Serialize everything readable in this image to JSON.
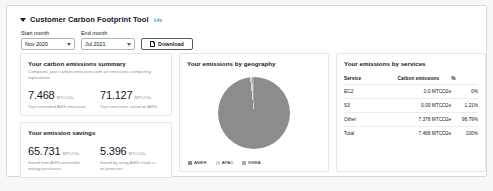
{
  "panel": {
    "title": "Customer Carbon Footprint Tool",
    "info_label": "Info",
    "collapse_icon": "caret-down-icon"
  },
  "controls": {
    "start_month": {
      "label": "Start month",
      "value": "Nov 2020"
    },
    "end_month": {
      "label": "End month",
      "value": "Jul 2021"
    },
    "download": {
      "label": "Download",
      "icon": "document-download-icon"
    },
    "chevron_icon": "chevron-down-icon"
  },
  "summary_card": {
    "title": "Your carbon emissions summary",
    "subtitle": "Compares your carbon emissions with an emissions comparing equivalents",
    "metrics": [
      {
        "value": "7.468",
        "unit": "MTCO2e",
        "caption": "Your estimated AWS emissions"
      },
      {
        "value": "71.127",
        "unit": "MTCO2e",
        "caption": "Your emissions saved on AWS"
      }
    ]
  },
  "savings_card": {
    "title": "Your emission savings",
    "metrics": [
      {
        "value": "65.731",
        "unit": "MTCO2e",
        "caption": "Saved from AWS renewable energy purchases"
      },
      {
        "value": "5.396",
        "unit": "MTCO2e",
        "caption": "Saved by using AWS cloud vs. on-premises"
      }
    ]
  },
  "geography_card": {
    "title": "Your emissions by geography",
    "colors": {
      "AMER": "#8c8c8c",
      "APAC": "#d8d8d8",
      "EMEA": "#a8a8a8"
    },
    "legend": [
      {
        "label": "AMER",
        "color": "#8c8c8c"
      },
      {
        "label": "APAC",
        "color": "#d8d8d8"
      },
      {
        "label": "EMEA",
        "color": "#a8a8a8"
      }
    ]
  },
  "services_card": {
    "title": "Your emissions by services",
    "columns": [
      "Service",
      "Carbon emissions",
      "%"
    ],
    "rows": [
      {
        "service": "EC2",
        "emissions": "0.0 MTCO2e",
        "percent": "0%"
      },
      {
        "service": "S3",
        "emissions": "0.09 MTCO2e",
        "percent": "1.21%"
      },
      {
        "service": "Other",
        "emissions": "7.378 MTCO2e",
        "percent": "98.79%"
      },
      {
        "service": "Total",
        "emissions": "7.468 MTCO2e",
        "percent": "100%"
      }
    ]
  },
  "chart_data": {
    "type": "pie",
    "title": "Your emissions by geography",
    "categories": [
      "AMER",
      "APAC",
      "EMEA"
    ],
    "values": [
      98.2,
      1.0,
      0.8
    ],
    "unit": "percent",
    "legend_position": "bottom"
  }
}
